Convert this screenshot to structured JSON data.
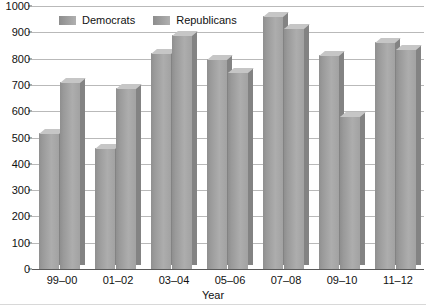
{
  "chart_data": {
    "type": "bar",
    "title": "",
    "xlabel": "Year",
    "ylabel": "",
    "ylim": [
      0,
      1000
    ],
    "ytick_step": 100,
    "grid": true,
    "legend_position": "top-center",
    "categories": [
      "99–00",
      "01–02",
      "03–04",
      "05–06",
      "07–08",
      "09–10",
      "11–12"
    ],
    "yticks": [
      "0",
      "100",
      "200",
      "300",
      "400",
      "500",
      "600",
      "700",
      "800",
      "900",
      "1000"
    ],
    "series": [
      {
        "name": "Democrats",
        "color": "#a0a0a0",
        "values": [
          518,
          460,
          820,
          800,
          962,
          815,
          865
        ]
      },
      {
        "name": "Republicans",
        "color": "#a8a8a8",
        "values": [
          712,
          690,
          888,
          748,
          915,
          580,
          835
        ]
      }
    ]
  },
  "legend": {
    "items": [
      {
        "label": "Democrats"
      },
      {
        "label": "Republicans"
      }
    ]
  },
  "axis": {
    "x_title": "Year"
  }
}
